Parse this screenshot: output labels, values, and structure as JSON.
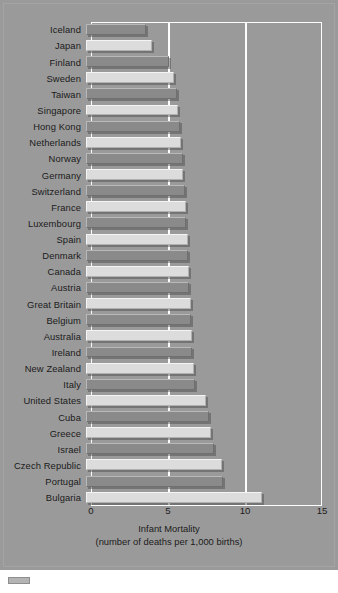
{
  "chart_data": {
    "type": "bar",
    "orientation": "horizontal",
    "title": "",
    "xlabel_line1": "Infant Mortality",
    "xlabel_line2": "(number of deaths per 1,000 births)",
    "ylabel": "",
    "xlim": [
      0,
      15
    ],
    "xticks": [
      0,
      5,
      10,
      15
    ],
    "xticklabels": [
      "0",
      "5",
      "10",
      "15"
    ],
    "gridlines_at": [
      5,
      10
    ],
    "grid": true,
    "legend": "none",
    "categories": [
      "Iceland",
      "Japan",
      "Finland",
      "Sweden",
      "Taiwan",
      "Singapore",
      "Hong Kong",
      "Netherlands",
      "Norway",
      "Germany",
      "Switzerland",
      "France",
      "Luxembourg",
      "Spain",
      "Denmark",
      "Canada",
      "Austria",
      "Great Britain",
      "Belgium",
      "Australia",
      "Ireland",
      "New Zealand",
      "Italy",
      "United States",
      "Cuba",
      "Greece",
      "Israel",
      "Czech Republic",
      "Portugal",
      "Bulgaria"
    ],
    "values": [
      3.9,
      4.3,
      5.4,
      5.7,
      5.9,
      6.0,
      6.1,
      6.2,
      6.3,
      6.3,
      6.4,
      6.5,
      6.5,
      6.6,
      6.6,
      6.7,
      6.7,
      6.8,
      6.8,
      6.9,
      6.9,
      7.0,
      7.1,
      7.8,
      8.0,
      8.1,
      8.3,
      8.8,
      8.9,
      11.4
    ],
    "bar_colors_alternating": [
      "#8a8a8a",
      "#dcdcdc"
    ],
    "background_color": "#9a9a9a",
    "frame_color": "#fdfdfd",
    "text_color": "#1b1b1b"
  },
  "figure": {
    "footer_swatch": "legend-swatch"
  }
}
